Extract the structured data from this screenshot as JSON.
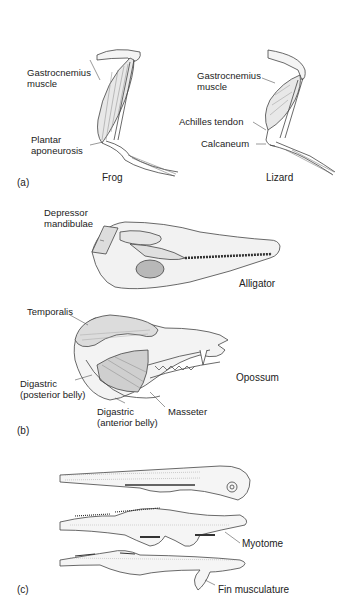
{
  "figure": {
    "panels": [
      {
        "id": "a",
        "marker": "(a)",
        "specimens": [
          {
            "name": "Frog",
            "labels": [
              "Gastrocnemius muscle",
              "Plantar aponeurosis"
            ]
          },
          {
            "name": "Lizard",
            "labels": [
              "Gastrocnemius muscle",
              "Achilles tendon",
              "Calcaneum"
            ]
          }
        ]
      },
      {
        "id": "b",
        "marker": "(b)",
        "specimens": [
          {
            "name": "Alligator",
            "labels": [
              "Depressor mandibulae"
            ]
          },
          {
            "name": "Opossum",
            "labels": [
              "Temporalis",
              "Digastric (posterior belly)",
              "Digastric (anterior belly)",
              "Masseter"
            ]
          }
        ]
      },
      {
        "id": "c",
        "marker": "(c)",
        "specimens": [
          {
            "name": "Fish embryos",
            "labels": [
              "Myotome",
              "Fin musculature"
            ]
          }
        ]
      }
    ]
  },
  "labels": {
    "frog_gastro_1": "Gastrocnemius",
    "frog_gastro_2": "muscle",
    "frog_plantar_1": "Plantar",
    "frog_plantar_2": "aponeurosis",
    "frog_name": "Frog",
    "lizard_gastro_1": "Gastrocnemius",
    "lizard_gastro_2": "muscle",
    "lizard_achilles": "Achilles tendon",
    "lizard_calcaneum": "Calcaneum",
    "lizard_name": "Lizard",
    "panel_a": "(a)",
    "alligator_dep_1": "Depressor",
    "alligator_dep_2": "mandibulae",
    "alligator_name": "Alligator",
    "opossum_temporalis": "Temporalis",
    "opossum_dig_post_1": "Digastric",
    "opossum_dig_post_2": "(posterior belly)",
    "opossum_dig_ant_1": "Digastric",
    "opossum_dig_ant_2": "(anterior belly)",
    "opossum_masseter": "Masseter",
    "opossum_name": "Opossum",
    "panel_b": "(b)",
    "fish_myotome": "Myotome",
    "fish_fin": "Fin musculature",
    "panel_c": "(c)"
  }
}
